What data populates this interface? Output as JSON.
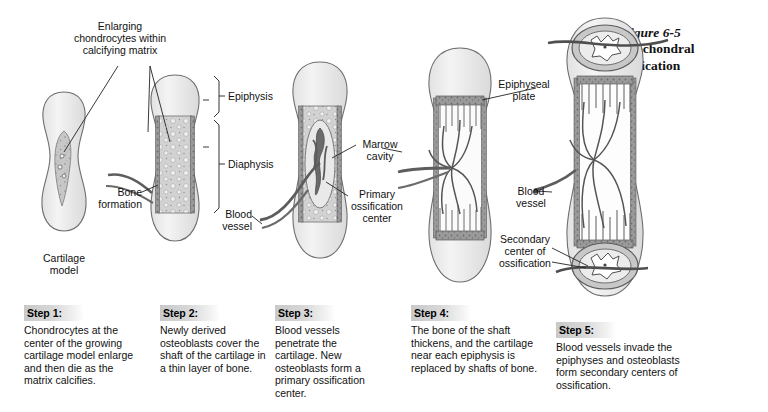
{
  "figure": {
    "bullet": "●",
    "number": "Figure 6-5",
    "title_line1": "Endochondral",
    "title_line2": "Ossification"
  },
  "colors": {
    "cartilage_fill": "#ececec",
    "calcified_fill": "#b9b9b9",
    "bone_collar": "#9a9a9a",
    "outline": "#5a5a5a",
    "vessel": "#4a4a4a",
    "step_header_bg": "#cccccc",
    "text": "#111111"
  },
  "annotations": [
    {
      "id": "enlarging-chondrocytes",
      "text": "Enlarging\nchondrocytes within\ncalcifying matrix",
      "align": "center"
    },
    {
      "id": "epiphysis",
      "text": "Epiphysis",
      "align": "left"
    },
    {
      "id": "diaphysis",
      "text": "Diaphysis",
      "align": "left"
    },
    {
      "id": "bone-formation",
      "text": "Bone\nformation",
      "align": "right"
    },
    {
      "id": "cartilage-model",
      "text": "Cartilage\nmodel",
      "align": "center"
    },
    {
      "id": "blood-vessel-3",
      "text": "Blood\nvessel",
      "align": "right"
    },
    {
      "id": "marrow-cavity",
      "text": "Marrow\ncavity",
      "align": "center"
    },
    {
      "id": "primary-ossification-center",
      "text": "Primary\nossification\ncenter",
      "align": "center"
    },
    {
      "id": "epiphyseal-plate",
      "text": "Epiphyseal\nplate",
      "align": "center"
    },
    {
      "id": "blood-vessel-5",
      "text": "Blood\nvessel",
      "align": "center"
    },
    {
      "id": "secondary-center-of-ossification",
      "text": "Secondary\ncenter of\nossification",
      "align": "center"
    }
  ],
  "steps": [
    {
      "id": "step-1",
      "header": "Step 1:",
      "body": "Chondrocytes at the center of the growing cartilage model enlarge and then die as the matrix calcifies."
    },
    {
      "id": "step-2",
      "header": "Step 2:",
      "body": "Newly derived osteoblasts cover the shaft of the cartilage in a thin layer of bone."
    },
    {
      "id": "step-3",
      "header": "Step 3:",
      "body": "Blood vessels penetrate the cartilage. New osteoblasts form a primary ossification center."
    },
    {
      "id": "step-4",
      "header": "Step 4:",
      "body": "The bone of the shaft thickens, and the cartilage near each epiphysis is replaced by shafts of bone."
    },
    {
      "id": "step-5",
      "header": "Step 5:",
      "body": "Blood vessels invade the epiphyses and osteoblasts form secondary centers of ossification."
    }
  ]
}
